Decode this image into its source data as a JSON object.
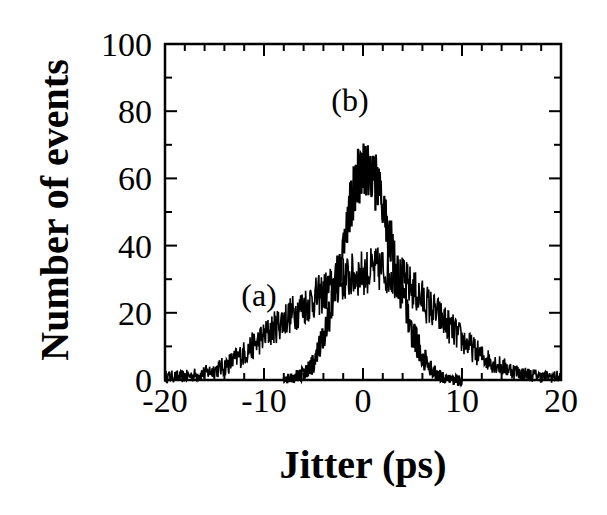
{
  "chart_data": {
    "type": "line",
    "title": "",
    "xlabel": "Jitter (ps)",
    "ylabel": "Number of events",
    "xlim": [
      -20,
      20
    ],
    "ylim": [
      0,
      100
    ],
    "xticks": [
      -20,
      -10,
      0,
      10,
      20
    ],
    "xtick_labels": [
      "-20",
      "-10",
      "0",
      "10",
      "20"
    ],
    "yticks": [
      0,
      20,
      40,
      60,
      80,
      100
    ],
    "ytick_labels": [
      "0",
      "20",
      "40",
      "60",
      "80",
      "100"
    ],
    "x_minor_step": 2,
    "y_minor_step": 10,
    "grid": false,
    "legend": null,
    "annotations": [
      {
        "text": "(a)",
        "x": -12.3,
        "y": 22
      },
      {
        "text": "(b)",
        "x": -3.2,
        "y": 80
      }
    ],
    "series": [
      {
        "name": "(a)",
        "description": "broad noisy jitter histogram, approx. Gaussian, sigma ~7 ps, peak ~30-35 near 0-2 ps",
        "x": [
          -20,
          -18,
          -16,
          -14,
          -12,
          -10,
          -8,
          -6,
          -4,
          -2,
          0,
          2,
          4,
          6,
          8,
          10,
          12,
          14,
          16,
          18,
          20
        ],
        "values": [
          1,
          1,
          2,
          4,
          8,
          13,
          18,
          22,
          26,
          30,
          32,
          33,
          30,
          24,
          18,
          12,
          7,
          4,
          2,
          1,
          1
        ]
      },
      {
        "name": "(b)",
        "description": "narrow noisy jitter histogram, sigma ~3 ps, peak ~65 (max spike ~79) near 0 ps",
        "x": [
          -8,
          -7,
          -6,
          -5,
          -4,
          -3,
          -2,
          -1,
          0,
          1,
          2,
          3,
          4,
          5,
          6,
          7,
          8,
          9,
          10
        ],
        "values": [
          0,
          1,
          2,
          5,
          12,
          25,
          40,
          55,
          65,
          62,
          52,
          38,
          25,
          14,
          7,
          3,
          1,
          0,
          0
        ]
      }
    ]
  }
}
